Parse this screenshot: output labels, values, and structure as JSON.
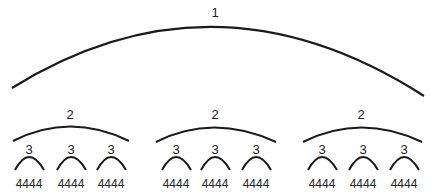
{
  "diagram": {
    "level1": {
      "label": "1"
    },
    "groups": [
      {
        "label": "2",
        "children": [
          {
            "label": "3",
            "leaf": "4444"
          },
          {
            "label": "3",
            "leaf": "4444"
          },
          {
            "label": "3",
            "leaf": "4444"
          }
        ]
      },
      {
        "label": "2",
        "children": [
          {
            "label": "3",
            "leaf": "4444"
          },
          {
            "label": "3",
            "leaf": "4444"
          },
          {
            "label": "3",
            "leaf": "4444"
          }
        ]
      },
      {
        "label": "2",
        "children": [
          {
            "label": "3",
            "leaf": "4444"
          },
          {
            "label": "3",
            "leaf": "4444"
          },
          {
            "label": "3",
            "leaf": "4444"
          }
        ]
      }
    ],
    "stroke_color": "#1a1a1a"
  }
}
